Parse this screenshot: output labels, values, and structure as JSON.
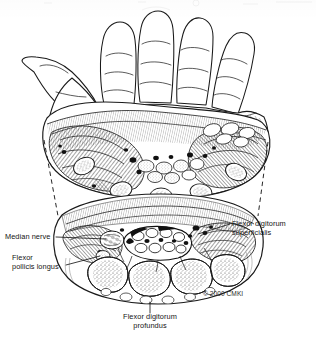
{
  "figure": {
    "background_color": "#ffffff",
    "ink_color": "#141414",
    "style": "pen-and-ink medical line illustration, stipple and hatch shading"
  },
  "labels": {
    "median_nerve": "Median nerve",
    "flexor_pollicis_longus_line1": "Flexor",
    "flexor_pollicis_longus_line2": "pollicis longus",
    "flexor_digitorum_superficialis_line1": "Flexor digitorum",
    "flexor_digitorum_superficialis_line2": "superficialis",
    "flexor_digitorum_profundus_line1": "Flexor digitorum",
    "flexor_digitorum_profundus_line2": "profundus"
  },
  "copyright": "© 2000 CMKI",
  "sections": {
    "upper": {
      "name": "distal-palm-cross-section",
      "description": "Oblique transverse section through the distal palm showing thenar and hypothenar muscle bellies, flexor tendons and neurovascular bundles"
    },
    "lower": {
      "name": "carpal-tunnel-cross-section",
      "description": "Transverse section at the level of the carpal tunnel showing carpal bones, flexor tendon bundle, median nerve and flexor retinaculum"
    }
  },
  "connectors": {
    "left_dashed_projection": "dashed line linking left edge of palm section to carpal section",
    "right_dashed_projection": "dashed line linking right edge of palm section to carpal section"
  }
}
